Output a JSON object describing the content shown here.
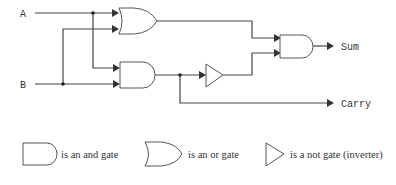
{
  "diagram": {
    "type": "logic-circuit",
    "inputs": [
      {
        "id": "A",
        "label": "A"
      },
      {
        "id": "B",
        "label": "B"
      }
    ],
    "outputs": [
      {
        "id": "sum",
        "label": "Sum"
      },
      {
        "id": "carry",
        "label": "Carry"
      }
    ],
    "gates": [
      {
        "id": "or1",
        "type": "or",
        "inputs": [
          "A",
          "B"
        ]
      },
      {
        "id": "and1",
        "type": "and",
        "inputs": [
          "A",
          "B"
        ]
      },
      {
        "id": "not1",
        "type": "not",
        "inputs": [
          "and1"
        ]
      },
      {
        "id": "and2",
        "type": "and",
        "inputs": [
          "or1",
          "not1"
        ]
      }
    ],
    "connections": [
      {
        "from": "and2",
        "to": "sum"
      },
      {
        "from": "and1",
        "to": "carry"
      }
    ]
  },
  "legend": {
    "and_label": "is an and gate",
    "or_label": "is an or gate",
    "not_label": "is a not gate (inverter)"
  }
}
